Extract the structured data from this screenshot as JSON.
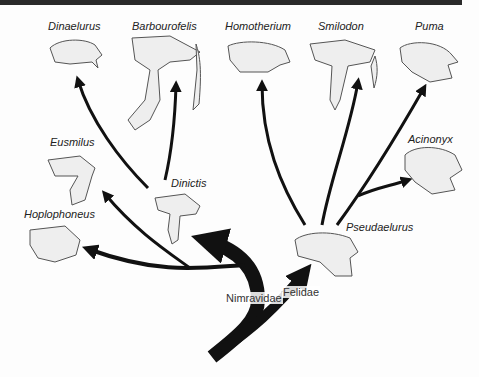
{
  "diagram": {
    "type": "phylogenetic-tree",
    "clades": {
      "nimravidae": "Nimravidae",
      "felidae": "Felidae"
    },
    "taxa": {
      "dinaelurus": "Dinaelurus",
      "barbourofelis": "Barbourofelis",
      "homotherium": "Homotherium",
      "smilodon": "Smilodon",
      "puma": "Puma",
      "eusmilus": "Eusmilus",
      "acinonyx": "Acinonyx",
      "dinictis": "Dinictis",
      "hoplophoneus": "Hoplophoneus",
      "pseudaelurus": "Pseudaelurus"
    },
    "edges": [
      {
        "from": "root",
        "to": "nimravidae"
      },
      {
        "from": "root",
        "to": "felidae"
      },
      {
        "from": "nimravidae",
        "to": "Dinictis"
      },
      {
        "from": "nimravidae",
        "to": "Hoplophoneus"
      },
      {
        "from": "nimravidae",
        "to": "Eusmilus"
      },
      {
        "from": "nimravidae",
        "to": "Dinaelurus"
      },
      {
        "from": "Dinictis",
        "to": "Barbourofelis"
      },
      {
        "from": "felidae",
        "to": "Pseudaelurus"
      },
      {
        "from": "Pseudaelurus",
        "to": "Homotherium"
      },
      {
        "from": "Pseudaelurus",
        "to": "Smilodon"
      },
      {
        "from": "Pseudaelurus",
        "to": "Puma"
      },
      {
        "from": "Pseudaelurus",
        "to": "Acinonyx"
      }
    ],
    "colors": {
      "line": "#111111",
      "skull_fill": "#eeeeee",
      "skull_stroke": "#555555",
      "top_bar": "#2a2a2a"
    }
  }
}
